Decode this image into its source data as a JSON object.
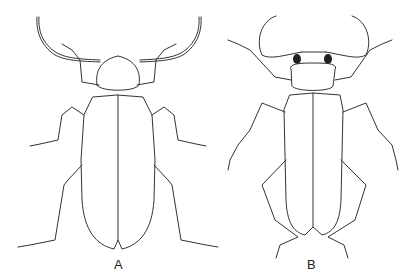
{
  "figure": {
    "type": "scientific-line-illustration",
    "line_color": "#333333",
    "background": "#ffffff",
    "specimens": [
      {
        "label": "A",
        "description": "elongate beetle with rounded pronotum and long segmented antennae"
      },
      {
        "label": "B",
        "description": "beetle with transverse pronotum, dark eyes, curved antennae and long legs"
      }
    ]
  }
}
